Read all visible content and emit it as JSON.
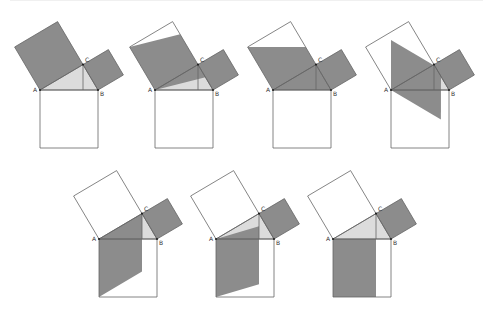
{
  "colors": {
    "dark_fill": "#8c8c8c",
    "light_fill": "#dcdcdc",
    "line": "#666666",
    "point": "#222222",
    "background": "#ffffff"
  },
  "labels": {
    "a": "A",
    "b": "B",
    "c": "C"
  },
  "geometry": {
    "A": [
      0,
      0
    ],
    "B": [
      58,
      0
    ],
    "C": [
      43,
      -25.4
    ],
    "H": [
      43,
      0
    ],
    "square_ac": [
      [
        0,
        0
      ],
      [
        43,
        -25.4
      ],
      [
        17.6,
        -68.4
      ],
      [
        -25.4,
        -43
      ]
    ],
    "square_cb": [
      [
        43,
        -25.4
      ],
      [
        58,
        0
      ],
      [
        83.4,
        -15
      ],
      [
        68.4,
        -40.4
      ]
    ],
    "square_ab": [
      [
        0,
        0
      ],
      [
        58,
        0
      ],
      [
        58,
        58
      ],
      [
        0,
        58
      ]
    ],
    "triangle": [
      [
        0,
        0
      ],
      [
        58,
        0
      ],
      [
        43,
        -25.4
      ]
    ]
  },
  "panels": [
    {
      "id": 1,
      "origin": [
        40,
        90
      ],
      "triangle_light": true,
      "shape": [
        [
          0,
          0
        ],
        [
          43,
          -25.4
        ],
        [
          17.6,
          -68.4
        ],
        [
          -25.4,
          -43
        ]
      ]
    },
    {
      "id": 2,
      "origin": [
        155,
        90
      ],
      "triangle_light": true,
      "shape": [
        [
          0,
          0
        ],
        [
          -25.4,
          -43
        ],
        [
          25.1,
          -55.7
        ],
        [
          50.5,
          -12.7
        ]
      ]
    },
    {
      "id": 3,
      "origin": [
        273,
        90
      ],
      "triangle_light": true,
      "shape": [
        [
          0,
          0
        ],
        [
          -25.4,
          -43
        ],
        [
          32.6,
          -43
        ],
        [
          58,
          0
        ]
      ]
    },
    {
      "id": 4,
      "origin": [
        391,
        90
      ],
      "triangle_light": true,
      "shape": [
        [
          0,
          0
        ],
        [
          0,
          -49.9
        ],
        [
          50,
          -20.4
        ],
        [
          49.9,
          29.5
        ]
      ]
    },
    {
      "id": 5,
      "origin": [
        99,
        239
      ],
      "triangle_light": true,
      "shape": [
        [
          0,
          0
        ],
        [
          43,
          -25.4
        ],
        [
          43,
          32.6
        ],
        [
          0,
          58
        ]
      ]
    },
    {
      "id": 6,
      "origin": [
        216,
        239
      ],
      "triangle_light": true,
      "shape": [
        [
          0,
          0
        ],
        [
          43,
          -12.7
        ],
        [
          43,
          45.3
        ],
        [
          0,
          58
        ]
      ]
    },
    {
      "id": 7,
      "origin": [
        333,
        239
      ],
      "triangle_light": true,
      "shape": [
        [
          0,
          0
        ],
        [
          43,
          0
        ],
        [
          43,
          58
        ],
        [
          0,
          58
        ]
      ]
    }
  ]
}
